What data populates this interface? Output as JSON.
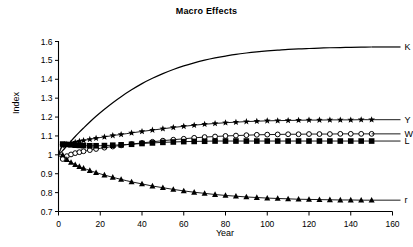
{
  "chart_data": {
    "type": "line",
    "title": "Macro Effects",
    "xlabel": "Year",
    "ylabel": "Index",
    "xlim": [
      0,
      160
    ],
    "ylim": [
      0.7,
      1.6
    ],
    "xticks": [
      0,
      20,
      40,
      60,
      80,
      100,
      120,
      140,
      160
    ],
    "xtick_labels": [
      "0",
      "20",
      "40",
      "60",
      "80",
      "100",
      "120",
      "140",
      "160"
    ],
    "yticks": [
      0.7,
      0.8,
      0.9,
      1.0,
      1.1,
      1.2,
      1.3,
      1.4,
      1.5,
      1.6
    ],
    "ytick_labels": [
      "0.7",
      "0.8",
      "0.9",
      "1",
      "1.1",
      "1.2",
      "1.3",
      "1.4",
      "1.5",
      "1.6"
    ],
    "grid": false,
    "legend_position": "right-inline",
    "x": [
      0,
      2,
      4,
      6,
      8,
      10,
      12,
      15,
      18,
      22,
      26,
      30,
      35,
      40,
      45,
      50,
      55,
      60,
      65,
      70,
      75,
      80,
      85,
      90,
      95,
      100,
      105,
      110,
      115,
      120,
      125,
      130,
      135,
      140,
      145,
      150
    ],
    "series": [
      {
        "name": "K",
        "label": "K",
        "marker": "none",
        "color": "#000000",
        "values": [
          1.0,
          1.022,
          1.048,
          1.073,
          1.097,
          1.12,
          1.142,
          1.174,
          1.204,
          1.241,
          1.276,
          1.308,
          1.344,
          1.377,
          1.405,
          1.43,
          1.452,
          1.471,
          1.487,
          1.501,
          1.513,
          1.523,
          1.532,
          1.539,
          1.545,
          1.55,
          1.554,
          1.558,
          1.561,
          1.563,
          1.565,
          1.567,
          1.568,
          1.569,
          1.57,
          1.571
        ]
      },
      {
        "name": "Y",
        "label": "Y",
        "marker": "star",
        "color": "#000000",
        "values": [
          1.0,
          1.048,
          1.056,
          1.062,
          1.067,
          1.072,
          1.076,
          1.082,
          1.088,
          1.095,
          1.102,
          1.108,
          1.116,
          1.124,
          1.131,
          1.138,
          1.145,
          1.151,
          1.157,
          1.162,
          1.166,
          1.17,
          1.173,
          1.176,
          1.178,
          1.18,
          1.181,
          1.182,
          1.183,
          1.184,
          1.184,
          1.185,
          1.185,
          1.185,
          1.186,
          1.186
        ]
      },
      {
        "name": "W",
        "label": "W",
        "marker": "circle-open",
        "color": "#000000",
        "values": [
          1.0,
          0.978,
          0.993,
          1.002,
          1.009,
          1.014,
          1.019,
          1.025,
          1.031,
          1.038,
          1.044,
          1.05,
          1.057,
          1.063,
          1.069,
          1.075,
          1.08,
          1.085,
          1.09,
          1.094,
          1.097,
          1.1,
          1.102,
          1.104,
          1.106,
          1.107,
          1.108,
          1.109,
          1.109,
          1.11,
          1.11,
          1.11,
          1.111,
          1.111,
          1.111,
          1.111
        ]
      },
      {
        "name": "L",
        "label": "L",
        "marker": "square-filled",
        "color": "#000000",
        "values": [
          1.0,
          1.057,
          1.055,
          1.053,
          1.051,
          1.05,
          1.049,
          1.048,
          1.048,
          1.049,
          1.051,
          1.053,
          1.056,
          1.06,
          1.063,
          1.066,
          1.068,
          1.07,
          1.071,
          1.072,
          1.073,
          1.073,
          1.073,
          1.073,
          1.073,
          1.073,
          1.073,
          1.073,
          1.073,
          1.073,
          1.073,
          1.073,
          1.073,
          1.073,
          1.073,
          1.073
        ]
      },
      {
        "name": "r",
        "label": "r",
        "marker": "triangle-filled",
        "color": "#000000",
        "values": [
          1.0,
          1.0,
          0.975,
          0.96,
          0.948,
          0.938,
          0.929,
          0.917,
          0.906,
          0.893,
          0.881,
          0.87,
          0.857,
          0.846,
          0.835,
          0.826,
          0.817,
          0.809,
          0.802,
          0.796,
          0.79,
          0.785,
          0.781,
          0.777,
          0.774,
          0.771,
          0.769,
          0.767,
          0.765,
          0.764,
          0.763,
          0.762,
          0.761,
          0.761,
          0.76,
          0.76
        ]
      }
    ]
  }
}
